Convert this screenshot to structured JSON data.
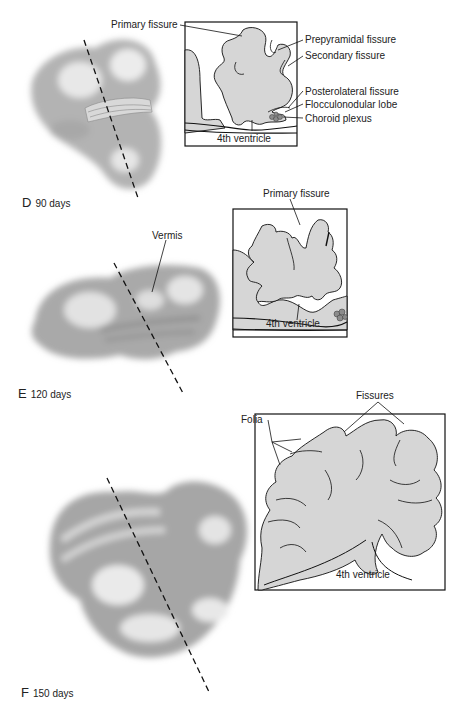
{
  "figure": {
    "panels": [
      {
        "id": "D",
        "letter": "D",
        "age": "90 days",
        "labels": {
          "primary_fissure": "Primary fissure",
          "prepyramidal_fissure": "Prepyramidal fissure",
          "secondary_fissure": "Secondary fissure",
          "posterolateral_fissure": "Posterolateral fissure",
          "flocculonodular_lobe": "Flocculonodular lobe",
          "choroid_plexus": "Choroid plexus",
          "fourth_ventricle": "4th ventricle"
        }
      },
      {
        "id": "E",
        "letter": "E",
        "age": "120 days",
        "labels": {
          "vermis": "Vermis",
          "primary_fissure": "Primary fissure",
          "fourth_ventricle": "4th ventricle"
        }
      },
      {
        "id": "F",
        "letter": "F",
        "age": "150 days",
        "labels": {
          "folia": "Folia",
          "fissures": "Fissures",
          "fourth_ventricle": "4th ventricle"
        }
      }
    ],
    "colors": {
      "tissue_fill": "#d6d6d6",
      "outline": "#1a1a1a",
      "brain_shade": "#9a9a9a",
      "choroid": "#8c8c8c",
      "background": "#ffffff"
    }
  }
}
